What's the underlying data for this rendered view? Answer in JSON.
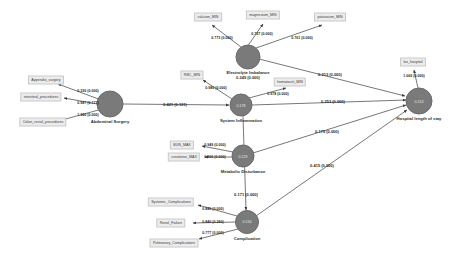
{
  "diagram": {
    "type": "structural-equation-model-path-diagram",
    "background": "#ffffff",
    "latent_fill": "#7a7a7a",
    "observed_fill": "#ececec",
    "edge_color": "#4a4a4a"
  },
  "latents": [
    {
      "id": "abdominal_surgery",
      "label": "Abdominal Surgery",
      "r2": "",
      "x": 110,
      "y": 104,
      "r": 12.5
    },
    {
      "id": "electrolyte_imbalance",
      "label": "Electrolyte Imbalance",
      "r2": "0.249 (0.000)",
      "x": 248,
      "y": 57,
      "r": 11.5
    },
    {
      "id": "system_inflammation",
      "label": "System Inflammation",
      "r2": "0.178",
      "x": 241,
      "y": 105,
      "r": 10.5
    },
    {
      "id": "metabolic_disturbance",
      "label": "Metabolic Disturbance",
      "r2": "0.129",
      "x": 243,
      "y": 156,
      "r": 10.5
    },
    {
      "id": "complication",
      "label": "Complication",
      "r2": "0.134",
      "x": 247,
      "y": 222,
      "r": 11
    },
    {
      "id": "hospital_length_of_stay",
      "label": "Hospital length of stay",
      "r2": "0.214",
      "x": 419,
      "y": 101,
      "r": 12.5
    }
  ],
  "observed": [
    {
      "id": "calcium_min",
      "label": "calcium_MIN",
      "x": 208,
      "y": 17
    },
    {
      "id": "magnesium_min",
      "label": "magnesium_MIN",
      "x": 263,
      "y": 15
    },
    {
      "id": "potassium_min",
      "label": "potassium_MIN",
      "x": 330,
      "y": 17
    },
    {
      "id": "los_hospital",
      "label": "los_hospital",
      "x": 413,
      "y": 62
    },
    {
      "id": "rbc_min",
      "label": "RBC_MIN",
      "x": 192,
      "y": 75
    },
    {
      "id": "hematocrit_min",
      "label": "hematocrit_MIN",
      "x": 290,
      "y": 82
    },
    {
      "id": "appendix_surgery",
      "label": "Appendix_surgery",
      "x": 46,
      "y": 80
    },
    {
      "id": "intestinal_procedures",
      "label": "intestinal_procedures",
      "x": 41,
      "y": 97
    },
    {
      "id": "colon_rectal_procedures",
      "label": "Colon_rectal_procedures",
      "x": 43,
      "y": 122
    },
    {
      "id": "bun_max",
      "label": "BUN_MAX",
      "x": 182,
      "y": 145
    },
    {
      "id": "creatinine_max",
      "label": "creatinine_MAX",
      "x": 184,
      "y": 157
    },
    {
      "id": "systemic_complications",
      "label": "Systemic_Complications",
      "x": 171,
      "y": 202
    },
    {
      "id": "renal_failure",
      "label": "Renal_Failure",
      "x": 171,
      "y": 223
    },
    {
      "id": "pulmonary_complications",
      "label": "Pulmonary_Complications",
      "x": 174,
      "y": 243
    }
  ],
  "coefficients": [
    {
      "id": "c_calcium",
      "text": "0.773 (0.000)",
      "x": 222,
      "y": 38
    },
    {
      "id": "c_magnesium",
      "text": "0.727 (0.000)",
      "x": 262,
      "y": 34
    },
    {
      "id": "c_potassium",
      "text": "0.761 (0.000)",
      "x": 302,
      "y": 38
    },
    {
      "id": "c_los_hospital",
      "text": "1.000 (0.000)",
      "x": 414,
      "y": 76
    },
    {
      "id": "c_rbc",
      "text": "0.980 (0.000)",
      "x": 216,
      "y": 88
    },
    {
      "id": "c_hematocrit",
      "text": "0.978 (0.000)",
      "x": 278,
      "y": 94
    },
    {
      "id": "c_appendix",
      "text": "0.330 (0.000)",
      "x": 88,
      "y": 91
    },
    {
      "id": "c_intestinal",
      "text": "0.987 (0.171)",
      "x": 88,
      "y": 103
    },
    {
      "id": "c_colon",
      "text": "1.360 (0.000)",
      "x": 88,
      "y": 115
    },
    {
      "id": "c_surg_inflam",
      "text": "0.421 (0.131)",
      "x": 175,
      "y": 104
    },
    {
      "id": "c_bun",
      "text": "0.949 (0.000)",
      "x": 215,
      "y": 145
    },
    {
      "id": "c_creatinine",
      "text": "0.906 (0.000)",
      "x": 215,
      "y": 157
    },
    {
      "id": "c_systemic",
      "text": "0.849 (0.000)",
      "x": 213,
      "y": 209
    },
    {
      "id": "c_renal",
      "text": "0.840 (0.260)",
      "x": 213,
      "y": 222
    },
    {
      "id": "c_pulmonary",
      "text": "0.777 (0.000)",
      "x": 213,
      "y": 233
    },
    {
      "id": "c_elec_los",
      "text": "0.213 (0.000)",
      "x": 330,
      "y": 74
    },
    {
      "id": "c_infl_los",
      "text": "0.253 (0.000)",
      "x": 333,
      "y": 101
    },
    {
      "id": "c_meta_los",
      "text": "0.179 (0.000)",
      "x": 327,
      "y": 131
    },
    {
      "id": "c_comp_los",
      "text": "0.415 (0.000)",
      "x": 322,
      "y": 165
    },
    {
      "id": "c_inflam_meta",
      "text": "0.171 (0.000)",
      "x": 246,
      "y": 194
    }
  ]
}
